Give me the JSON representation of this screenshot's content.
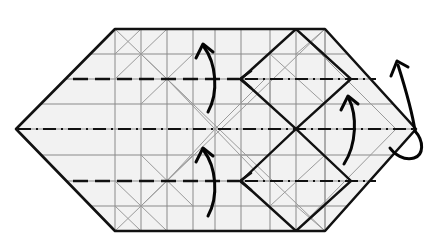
{
  "figure": {
    "title": "Origami crease pattern — hexagonal base with folding arrows",
    "type": "origami-step-diagram",
    "canvas": {
      "width": 439,
      "height": 248
    },
    "background_color": "#ffffff",
    "paper_fill_color": "#f2f2f2",
    "outline_color": "#111111",
    "grid_color": "#8a8a8a",
    "crease_color": "#111111",
    "arrow_color": "#050505"
  },
  "shape": {
    "name": "elongated-hexagon-sheet",
    "description": "Flat hexagonal paper with pointed left and right tips",
    "vertices": [
      {
        "name": "left-tip",
        "x": 16,
        "y": 129
      },
      {
        "name": "top-left",
        "x": 115,
        "y": 29
      },
      {
        "name": "top-right",
        "x": 325,
        "y": 29
      },
      {
        "name": "right-tip",
        "x": 416,
        "y": 129
      },
      {
        "name": "bottom-right",
        "x": 325,
        "y": 231
      },
      {
        "name": "bottom-left",
        "x": 115,
        "y": 231
      }
    ]
  },
  "grid": {
    "horizontal_y": [
      29,
      54,
      79,
      104,
      129,
      155,
      181,
      206,
      231
    ],
    "vertical_x": [
      115,
      141,
      167,
      193,
      215,
      241,
      270,
      296,
      325
    ],
    "cell_size": 26,
    "visible": true
  },
  "creases": [
    {
      "name": "center-mountain-line",
      "style": "mountain-dash-dot",
      "orientation": "horizontal",
      "y": 129,
      "x_start": 16,
      "x_end": 416
    },
    {
      "name": "upper-valley-line",
      "style": "valley-dashed",
      "orientation": "horizontal",
      "y": 79,
      "x_start": 73,
      "x_end": 241
    },
    {
      "name": "upper-mountain-continuation",
      "style": "mountain-dash-dot",
      "orientation": "horizontal",
      "y": 79,
      "x_start": 241,
      "x_end": 375
    },
    {
      "name": "lower-valley-line",
      "style": "valley-dashed",
      "orientation": "horizontal",
      "y": 181,
      "x_start": 73,
      "x_end": 241
    },
    {
      "name": "lower-mountain-continuation",
      "style": "mountain-dash-dot",
      "orientation": "horizontal",
      "y": 181,
      "x_start": 241,
      "x_end": 375
    },
    {
      "name": "upper-bold-diamond",
      "style": "bold-solid",
      "shape": "diamond",
      "points": "241,79 296,29 351,79 296,129"
    },
    {
      "name": "lower-bold-diamond",
      "style": "bold-solid",
      "shape": "diamond",
      "points": "241,181 296,231 351,181 296,129"
    }
  ],
  "arrows": [
    {
      "name": "upper-left-fold-arrow",
      "direction": "up",
      "meaning": "fold upper flap upward",
      "from": {
        "x": 208,
        "y": 112
      },
      "to": {
        "x": 203,
        "y": 46
      }
    },
    {
      "name": "lower-left-fold-arrow",
      "direction": "up",
      "meaning": "fold lower flap upward",
      "from": {
        "x": 208,
        "y": 216
      },
      "to": {
        "x": 203,
        "y": 150
      }
    },
    {
      "name": "right-fold-arrow",
      "direction": "up",
      "meaning": "fold right section upward",
      "from": {
        "x": 344,
        "y": 164
      },
      "to": {
        "x": 349,
        "y": 98
      }
    },
    {
      "name": "right-tip-wrap-arrow",
      "direction": "up-wrap-behind",
      "meaning": "wrap right tip around to the back",
      "from": {
        "x": 416,
        "y": 129
      },
      "to": {
        "x": 397,
        "y": 62
      }
    }
  ],
  "legend": {
    "mountain_fold": "dash-dot line",
    "valley_fold": "dashed line",
    "reference_crease": "thin grey line",
    "paper_edge": "thick solid line",
    "fold_motion": "curved arrow"
  }
}
